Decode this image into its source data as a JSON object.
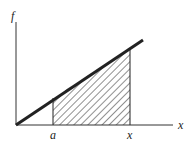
{
  "diagram": {
    "y_axis_label": "f",
    "x_axis_label": "x",
    "tick_labels": {
      "lower": "a",
      "upper": "x"
    },
    "shading": "hatched area under line between a and x",
    "colors": {
      "ink": "#222222",
      "background": "#ffffff"
    }
  }
}
